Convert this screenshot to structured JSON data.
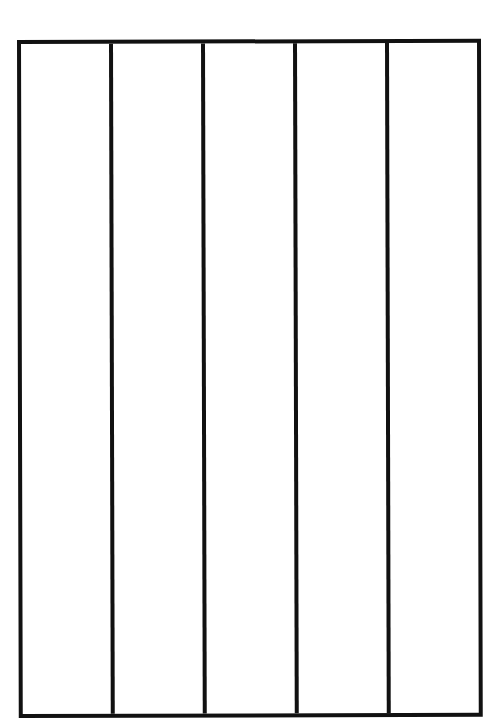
{
  "diagram": {
    "type": "column-grid",
    "columns": 5,
    "rows": 1,
    "border_color": "#111111",
    "fill_color": "#ffffff",
    "cells": [
      {
        "label": ""
      },
      {
        "label": ""
      },
      {
        "label": ""
      },
      {
        "label": ""
      },
      {
        "label": ""
      }
    ]
  }
}
